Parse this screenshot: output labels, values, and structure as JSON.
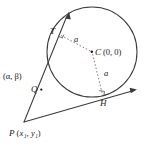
{
  "figure": {
    "stroke_color": "#3a3a3a",
    "dash_color": "#6b6b6b",
    "label_color": "#1a1a1a",
    "background": "#ffffff"
  },
  "labels": {
    "tangent_point_top": "T",
    "center_point": "C",
    "center_coords": "(0, 0)",
    "radius_upper": "a",
    "radius_lower": "a",
    "point_q": "Q",
    "point_q_coords": "(α, β)",
    "external_point": "P",
    "external_point_coords_p": "(",
    "external_point_x": "x",
    "external_point_x_sub": "1",
    "external_point_comma": ", ",
    "external_point_y": "y",
    "external_point_y_sub": "1",
    "external_point_close": ")",
    "tangent_point_bottom": "H"
  },
  "geometry": {
    "circle": {
      "cx": 92,
      "cy": 52,
      "r": 45
    },
    "points": {
      "C": {
        "x": 92,
        "y": 52
      },
      "T": {
        "x": 59,
        "y": 34
      },
      "H": {
        "x": 103,
        "y": 97
      },
      "Q": {
        "x": 41,
        "y": 90
      },
      "P": {
        "x": 24,
        "y": 122
      }
    },
    "tangent_top_arrow": {
      "x": 69,
      "y": 13
    },
    "tangent_bottom_arrow": {
      "x": 136,
      "y": 90
    }
  }
}
